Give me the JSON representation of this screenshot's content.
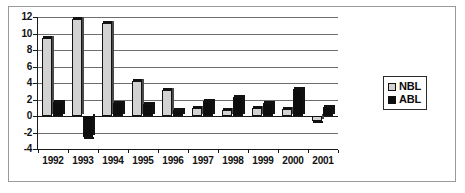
{
  "chart_data": {
    "type": "bar",
    "title": "",
    "subtitle": "",
    "xlabel": "",
    "ylabel": "",
    "categories": [
      "1992",
      "1993",
      "1994",
      "1995",
      "1996",
      "1997",
      "1998",
      "1999",
      "2000",
      "2001"
    ],
    "series": [
      {
        "name": "NBL",
        "color": "#d2d2d2",
        "values": [
          9.4,
          11.8,
          11.3,
          4.3,
          3.1,
          1.0,
          0.7,
          1.0,
          0.9,
          -0.6
        ]
      },
      {
        "name": "ABL",
        "color": "#0d0d0d",
        "values": [
          1.7,
          -2.6,
          1.6,
          1.5,
          0.7,
          1.8,
          2.3,
          1.6,
          3.3,
          1.1
        ]
      }
    ],
    "ylim": [
      -4,
      12
    ],
    "ytick_step": 2,
    "yticks": [
      "12",
      "10",
      "8",
      "6",
      "4",
      "2",
      "0",
      "-2",
      "-4"
    ],
    "grid": true,
    "grid_axis": "y",
    "legend_position": "right"
  },
  "legend": {
    "entries": [
      {
        "label": "NBL",
        "swatch": "#d2d2d2"
      },
      {
        "label": "ABL",
        "swatch": "#0d0d0d"
      }
    ]
  }
}
